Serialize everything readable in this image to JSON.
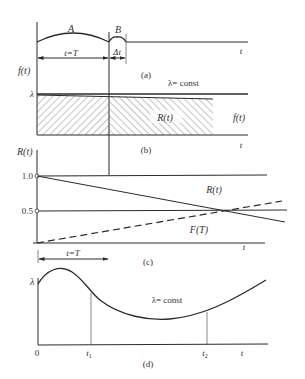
{
  "figure": {
    "panels": {
      "a": {
        "caption": "(a)",
        "arc_labels": {
          "first": "A",
          "second": "B"
        },
        "dimension_labels": {
          "interval": "t=T",
          "delta": "Δt"
        },
        "axis_label": "t",
        "y_label": "f(t)",
        "lambda_mark": "λ",
        "lambda_text": "λ= const"
      },
      "b": {
        "caption": "(b)",
        "region_label": "R(t)",
        "curve_label": "f(t)",
        "axis_label": "t"
      },
      "c": {
        "caption": "(c)",
        "y_label": "R(t)",
        "ticks": [
          "1.0",
          "0.5"
        ],
        "curve_labels": {
          "reliability": "R(t)",
          "failure": "F(T)"
        },
        "dimension_label": "t=T",
        "axis_label": "t"
      },
      "d": {
        "caption": "(d)",
        "y_label": "λ",
        "curve_text": "λ= const",
        "x_ticks": {
          "origin": "0",
          "t1": "t",
          "t1_sub": "1",
          "t2": "t",
          "t2_sub": "2",
          "axis": "t"
        }
      }
    },
    "colors": {
      "ink": "#2a2a2a",
      "text": "#333333",
      "background": "#ffffff"
    }
  }
}
